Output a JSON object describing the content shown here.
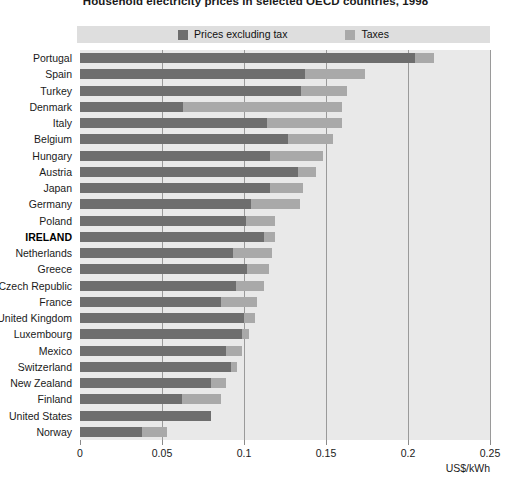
{
  "chart_data": {
    "type": "bar",
    "orientation": "horizontal",
    "stacked": true,
    "title": "Household electricity prices in selected OECD countries, 1998",
    "xlabel": "US$/kWh",
    "ylabel": "",
    "xlim": [
      0,
      0.25
    ],
    "xticks": [
      0,
      0.05,
      0.1,
      0.15,
      0.2,
      0.25
    ],
    "xtick_labels": [
      "0",
      "0.05",
      "0.1",
      "0.15",
      "0.2",
      "0.25"
    ],
    "grid": true,
    "grid_axis": "x",
    "legend_position": "top",
    "highlight_category": "IRELAND",
    "categories": [
      "Portugal",
      "Spain",
      "Turkey",
      "Denmark",
      "Italy",
      "Belgium",
      "Hungary",
      "Austria",
      "Japan",
      "Germany",
      "Poland",
      "IRELAND",
      "Netherlands",
      "Greece",
      "Czech Republic",
      "France",
      "United Kingdom",
      "Luxembourg",
      "Mexico",
      "Switzerland",
      "New Zealand",
      "Finland",
      "United States",
      "Norway"
    ],
    "series": [
      {
        "name": "Prices excluding tax",
        "color": "#6e6e6e",
        "values": [
          0.204,
          0.137,
          0.135,
          0.063,
          0.114,
          0.127,
          0.116,
          0.133,
          0.116,
          0.104,
          0.101,
          0.112,
          0.093,
          0.102,
          0.095,
          0.086,
          0.1,
          0.099,
          0.089,
          0.092,
          0.08,
          0.062,
          0.08,
          0.038
        ]
      },
      {
        "name": "Taxes",
        "color": "#a9a9a9",
        "values": [
          0.012,
          0.037,
          0.028,
          0.097,
          0.046,
          0.027,
          0.032,
          0.011,
          0.02,
          0.03,
          0.018,
          0.007,
          0.024,
          0.013,
          0.017,
          0.022,
          0.007,
          0.004,
          0.01,
          0.004,
          0.009,
          0.024,
          0.0,
          0.015
        ]
      }
    ],
    "totals": [
      0.216,
      0.174,
      0.163,
      0.16,
      0.16,
      0.154,
      0.148,
      0.144,
      0.136,
      0.134,
      0.119,
      0.119,
      0.117,
      0.115,
      0.112,
      0.108,
      0.107,
      0.103,
      0.099,
      0.096,
      0.089,
      0.086,
      0.08,
      0.053
    ]
  },
  "legend": {
    "items": [
      {
        "label": "Prices excluding tax",
        "color": "#6e6e6e"
      },
      {
        "label": "Taxes",
        "color": "#a9a9a9"
      }
    ]
  },
  "colors": {
    "prices_excluding_tax": "#6e6e6e",
    "taxes": "#a9a9a9",
    "plot_background": "#e9e9e9",
    "legend_background": "#dedede",
    "gridline": "#9a9a9a"
  }
}
